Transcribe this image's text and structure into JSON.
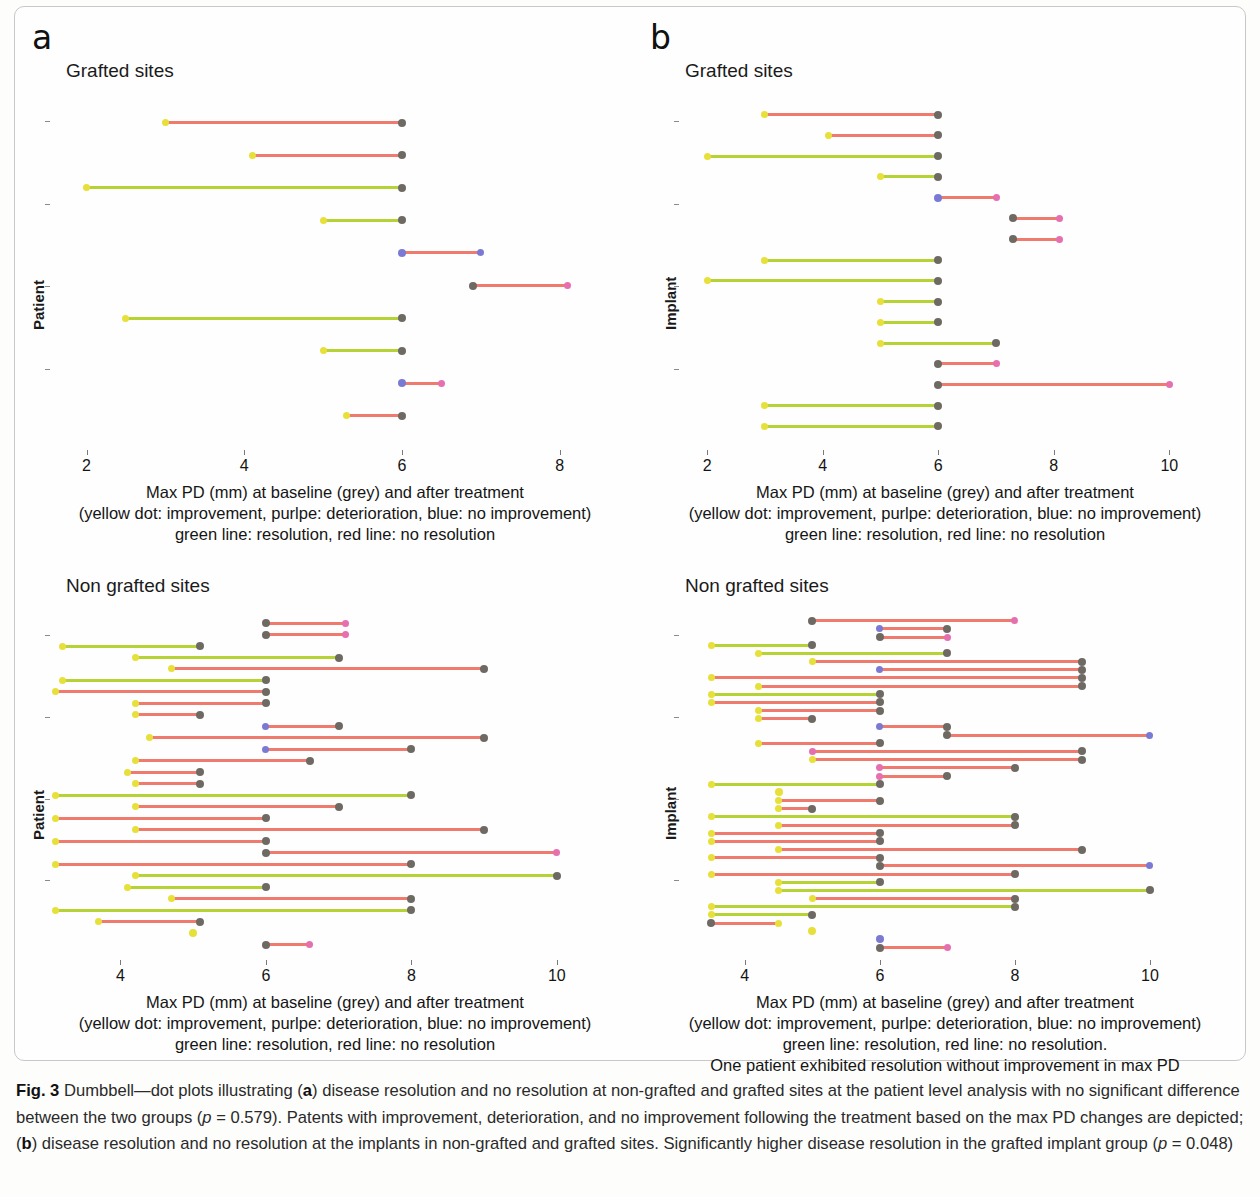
{
  "figure": {
    "caption_label": "Fig. 3",
    "caption_text": " Dumbbell—dot plots illustrating (a) disease resolution and no resolution at non-grafted and grafted sites at the patient level analysis with no significant difference between the two groups (p = 0.579). Patents with improvement, deterioration, and no improvement following the treatment based on the max PD changes are depicted; (b) disease resolution and no resolution at the implants in non-grafted and grafted sites. Significantly higher disease resolution in the grafted implant group (p = 0.048)"
  },
  "panels": {
    "a": {
      "letter": "a",
      "charts": [
        {
          "title": "Grafted sites",
          "ylabel": "Patient",
          "caption_lines": [
            "Max PD (mm) at baseline (grey) and after treatment",
            "(yellow dot: improvement, purlpe: deterioration, blue: no improvement)",
            "green line: resolution, red line: no resolution"
          ]
        },
        {
          "title": "Non grafted sites",
          "ylabel": "Patient",
          "caption_lines": [
            "Max PD (mm) at baseline (grey) and after treatment",
            "(yellow dot: improvement, purlpe: deterioration, blue: no improvement)",
            "green line: resolution, red line: no resolution"
          ]
        }
      ]
    },
    "b": {
      "letter": "b",
      "charts": [
        {
          "title": "Grafted sites",
          "ylabel": "Implant",
          "caption_lines": [
            "Max PD (mm) at baseline (grey) and after treatment",
            "(yellow dot: improvement, purlpe: deterioration, blue: no improvement)",
            "green line: resolution, red line: no resolution"
          ]
        },
        {
          "title": "Non grafted sites",
          "ylabel": "Implant",
          "caption_lines": [
            "Max PD (mm) at baseline (grey) and after treatment",
            "(yellow dot: improvement, purlpe: deterioration, blue: no improvement)",
            "green line: resolution, red line: no resolution.",
            "One patient exhibited resolution without improvement in max PD"
          ]
        }
      ]
    }
  },
  "colors": {
    "line_resolution": "#b5d334",
    "line_no_resolution": "#ef7b6e",
    "dot_baseline_grey": "#6e6a63",
    "dot_improvement_yellow": "#e8e03a",
    "dot_deterioration_purple": "#e66fb0",
    "dot_no_improvement_blue": "#7a7ad4"
  },
  "chart_data": [
    {
      "id": "a-grafted",
      "type": "dumbbell",
      "title": "Grafted sites",
      "xlabel": "Max PD (mm) at baseline (grey) and after treatment",
      "ylabel": "Patient",
      "xlim": [
        1.6,
        8.7
      ],
      "xticks": [
        2,
        4,
        6,
        8
      ],
      "grid": false,
      "legend": "none",
      "rows": [
        {
          "baseline": 6.0,
          "after": 3.0,
          "line": "no_resolution",
          "after_dot": "improvement"
        },
        {
          "baseline": 6.0,
          "after": 4.1,
          "line": "no_resolution",
          "after_dot": "improvement"
        },
        {
          "baseline": 6.0,
          "after": 2.0,
          "line": "resolution",
          "after_dot": "improvement"
        },
        {
          "baseline": 6.0,
          "after": 5.0,
          "line": "resolution",
          "after_dot": "improvement"
        },
        {
          "baseline": 6.0,
          "after": 7.0,
          "line": "no_resolution",
          "after_dot": "no_improvement",
          "dot_on_baseline": "no_improvement"
        },
        {
          "baseline": 6.9,
          "after": 8.1,
          "line": "no_resolution",
          "after_dot": "deterioration"
        },
        {
          "baseline": 6.0,
          "after": 2.5,
          "line": "resolution",
          "after_dot": "improvement"
        },
        {
          "baseline": 6.0,
          "after": 5.0,
          "line": "resolution",
          "after_dot": "improvement"
        },
        {
          "baseline": 6.0,
          "after": 6.5,
          "line": "no_resolution",
          "after_dot": "deterioration",
          "dot_on_baseline": "no_improvement"
        },
        {
          "baseline": 6.0,
          "after": 5.3,
          "line": "no_resolution",
          "after_dot": "improvement"
        }
      ]
    },
    {
      "id": "a-nongrafted",
      "type": "dumbbell",
      "title": "Non grafted sites",
      "xlabel": "Max PD (mm) at baseline (grey) and after treatment",
      "ylabel": "Patient",
      "xlim": [
        3.1,
        10.8
      ],
      "xticks": [
        4,
        6,
        8,
        10
      ],
      "grid": false,
      "legend": "none",
      "rows": [
        {
          "baseline": 6.0,
          "after": 7.1,
          "line": "no_resolution",
          "after_dot": "deterioration"
        },
        {
          "baseline": 6.0,
          "after": 7.1,
          "line": "no_resolution",
          "after_dot": "deterioration"
        },
        {
          "baseline": 5.1,
          "after": 3.2,
          "line": "resolution",
          "after_dot": "improvement"
        },
        {
          "baseline": 7.0,
          "after": 4.2,
          "line": "resolution",
          "after_dot": "improvement"
        },
        {
          "baseline": 9.0,
          "after": 4.7,
          "line": "no_resolution",
          "after_dot": "improvement"
        },
        {
          "baseline": 6.0,
          "after": 3.2,
          "line": "resolution",
          "after_dot": "improvement"
        },
        {
          "baseline": 6.0,
          "after": 3.1,
          "line": "no_resolution",
          "after_dot": "improvement"
        },
        {
          "baseline": 6.0,
          "after": 4.2,
          "line": "no_resolution",
          "after_dot": "improvement"
        },
        {
          "baseline": 5.1,
          "after": 4.2,
          "line": "no_resolution",
          "after_dot": "improvement"
        },
        {
          "baseline": 7.0,
          "after": 6.0,
          "line": "no_resolution",
          "after_dot": "no_improvement"
        },
        {
          "baseline": 9.0,
          "after": 4.4,
          "line": "no_resolution",
          "after_dot": "improvement"
        },
        {
          "baseline": 8.0,
          "after": 6.0,
          "line": "no_resolution",
          "after_dot": "no_improvement"
        },
        {
          "baseline": 6.6,
          "after": 4.2,
          "line": "no_resolution",
          "after_dot": "improvement"
        },
        {
          "baseline": 5.1,
          "after": 4.1,
          "line": "no_resolution",
          "after_dot": "improvement"
        },
        {
          "baseline": 5.1,
          "after": 4.2,
          "line": "no_resolution",
          "after_dot": "improvement"
        },
        {
          "baseline": 8.0,
          "after": 3.1,
          "line": "resolution",
          "after_dot": "improvement"
        },
        {
          "baseline": 7.0,
          "after": 4.2,
          "line": "no_resolution",
          "after_dot": "improvement"
        },
        {
          "baseline": 6.0,
          "after": 3.1,
          "line": "no_resolution",
          "after_dot": "improvement"
        },
        {
          "baseline": 9.0,
          "after": 4.2,
          "line": "no_resolution",
          "after_dot": "improvement"
        },
        {
          "baseline": 6.0,
          "after": 3.1,
          "line": "no_resolution",
          "after_dot": "improvement"
        },
        {
          "baseline": 6.0,
          "after": 10.0,
          "line": "no_resolution",
          "after_dot": "deterioration"
        },
        {
          "baseline": 8.0,
          "after": 3.1,
          "line": "no_resolution",
          "after_dot": "improvement"
        },
        {
          "baseline": 10.0,
          "after": 4.2,
          "line": "resolution",
          "after_dot": "improvement"
        },
        {
          "baseline": 6.0,
          "after": 4.1,
          "line": "resolution",
          "after_dot": "improvement"
        },
        {
          "baseline": 8.0,
          "after": 4.7,
          "line": "no_resolution",
          "after_dot": "improvement"
        },
        {
          "baseline": 8.0,
          "after": 3.1,
          "line": "resolution",
          "after_dot": "improvement"
        },
        {
          "baseline": 5.1,
          "after": 3.7,
          "line": "no_resolution",
          "after_dot": "improvement"
        },
        {
          "baseline": 5.0,
          "after": 5.0,
          "line": "resolution",
          "after_dot": "improvement",
          "single_point": true
        },
        {
          "baseline": 6.0,
          "after": 6.6,
          "line": "no_resolution",
          "after_dot": "deterioration"
        }
      ]
    },
    {
      "id": "b-grafted",
      "type": "dumbbell",
      "title": "Grafted sites",
      "xlabel": "Max PD (mm) at baseline (grey) and after treatment",
      "ylabel": "Implant",
      "xlim": [
        1.6,
        10.6
      ],
      "xticks": [
        2,
        4,
        6,
        8,
        10
      ],
      "grid": false,
      "legend": "none",
      "rows": [
        {
          "baseline": 6.0,
          "after": 3.0,
          "line": "no_resolution",
          "after_dot": "improvement"
        },
        {
          "baseline": 6.0,
          "after": 4.1,
          "line": "no_resolution",
          "after_dot": "improvement"
        },
        {
          "baseline": 6.0,
          "after": 2.0,
          "line": "resolution",
          "after_dot": "improvement"
        },
        {
          "baseline": 6.0,
          "after": 5.0,
          "line": "resolution",
          "after_dot": "improvement"
        },
        {
          "baseline": 6.0,
          "after": 7.0,
          "line": "no_resolution",
          "after_dot": "deterioration",
          "dot_on_baseline": "no_improvement"
        },
        {
          "baseline": 7.3,
          "after": 8.1,
          "line": "no_resolution",
          "after_dot": "deterioration"
        },
        {
          "baseline": 7.3,
          "after": 8.1,
          "line": "no_resolution",
          "after_dot": "deterioration"
        },
        {
          "baseline": 6.0,
          "after": 3.0,
          "line": "resolution",
          "after_dot": "improvement"
        },
        {
          "baseline": 6.0,
          "after": 2.0,
          "line": "resolution",
          "after_dot": "improvement"
        },
        {
          "baseline": 6.0,
          "after": 5.0,
          "line": "resolution",
          "after_dot": "improvement"
        },
        {
          "baseline": 6.0,
          "after": 5.0,
          "line": "resolution",
          "after_dot": "improvement"
        },
        {
          "baseline": 7.0,
          "after": 5.0,
          "line": "resolution",
          "after_dot": "improvement"
        },
        {
          "baseline": 6.0,
          "after": 7.0,
          "line": "no_resolution",
          "after_dot": "deterioration"
        },
        {
          "baseline": 6.0,
          "after": 10.0,
          "line": "no_resolution",
          "after_dot": "deterioration"
        },
        {
          "baseline": 6.0,
          "after": 3.0,
          "line": "resolution",
          "after_dot": "improvement"
        },
        {
          "baseline": 6.0,
          "after": 3.0,
          "line": "resolution",
          "after_dot": "improvement"
        }
      ]
    },
    {
      "id": "b-nongrafted",
      "type": "dumbbell",
      "title": "Non grafted sites",
      "xlabel": "Max PD (mm) at baseline (grey) and after treatment",
      "ylabel": "Implant",
      "xlim": [
        3.1,
        10.8
      ],
      "xticks": [
        4,
        6,
        8,
        10
      ],
      "grid": false,
      "legend": "none",
      "rows": [
        {
          "baseline": 5.0,
          "after": 8.0,
          "line": "no_resolution",
          "after_dot": "deterioration"
        },
        {
          "baseline": 7.0,
          "after": 6.0,
          "line": "no_resolution",
          "after_dot": "no_improvement"
        },
        {
          "baseline": 6.0,
          "after": 7.0,
          "line": "no_resolution",
          "after_dot": "deterioration"
        },
        {
          "baseline": 5.0,
          "after": 3.5,
          "line": "resolution",
          "after_dot": "improvement"
        },
        {
          "baseline": 7.0,
          "after": 4.2,
          "line": "resolution",
          "after_dot": "improvement"
        },
        {
          "baseline": 9.0,
          "after": 5.0,
          "line": "no_resolution",
          "after_dot": "improvement"
        },
        {
          "baseline": 9.0,
          "after": 6.0,
          "line": "no_resolution",
          "after_dot": "no_improvement"
        },
        {
          "baseline": 9.0,
          "after": 3.5,
          "line": "no_resolution",
          "after_dot": "improvement"
        },
        {
          "baseline": 9.0,
          "after": 4.2,
          "line": "no_resolution",
          "after_dot": "improvement"
        },
        {
          "baseline": 6.0,
          "after": 3.5,
          "line": "resolution",
          "after_dot": "improvement"
        },
        {
          "baseline": 6.0,
          "after": 3.5,
          "line": "no_resolution",
          "after_dot": "improvement"
        },
        {
          "baseline": 6.0,
          "after": 4.2,
          "line": "no_resolution",
          "after_dot": "improvement"
        },
        {
          "baseline": 5.0,
          "after": 4.2,
          "line": "no_resolution",
          "after_dot": "improvement"
        },
        {
          "baseline": 7.0,
          "after": 6.0,
          "line": "no_resolution",
          "after_dot": "no_improvement"
        },
        {
          "baseline": 7.0,
          "after": 10.0,
          "line": "no_resolution",
          "after_dot": "no_improvement"
        },
        {
          "baseline": 6.0,
          "after": 4.2,
          "line": "no_resolution",
          "after_dot": "improvement"
        },
        {
          "baseline": 9.0,
          "after": 5.0,
          "line": "no_resolution",
          "after_dot": "deterioration"
        },
        {
          "baseline": 9.0,
          "after": 5.0,
          "line": "no_resolution",
          "after_dot": "improvement"
        },
        {
          "baseline": 8.0,
          "after": 6.0,
          "line": "no_resolution",
          "after_dot": "deterioration"
        },
        {
          "baseline": 7.0,
          "after": 6.0,
          "line": "no_resolution",
          "after_dot": "deterioration"
        },
        {
          "baseline": 6.0,
          "after": 3.5,
          "line": "resolution",
          "after_dot": "improvement"
        },
        {
          "baseline": 4.5,
          "after": 4.5,
          "line": "resolution",
          "after_dot": "improvement",
          "single_point": true
        },
        {
          "baseline": 6.0,
          "after": 4.5,
          "line": "no_resolution",
          "after_dot": "improvement"
        },
        {
          "baseline": 5.0,
          "after": 4.5,
          "line": "no_resolution",
          "after_dot": "improvement"
        },
        {
          "baseline": 8.0,
          "after": 3.5,
          "line": "resolution",
          "after_dot": "improvement"
        },
        {
          "baseline": 8.0,
          "after": 4.5,
          "line": "no_resolution",
          "after_dot": "improvement"
        },
        {
          "baseline": 6.0,
          "after": 3.5,
          "line": "no_resolution",
          "after_dot": "improvement"
        },
        {
          "baseline": 6.0,
          "after": 3.5,
          "line": "no_resolution",
          "after_dot": "improvement"
        },
        {
          "baseline": 9.0,
          "after": 4.5,
          "line": "no_resolution",
          "after_dot": "improvement"
        },
        {
          "baseline": 6.0,
          "after": 3.5,
          "line": "no_resolution",
          "after_dot": "improvement"
        },
        {
          "baseline": 6.0,
          "after": 10.0,
          "line": "no_resolution",
          "after_dot": "no_improvement"
        },
        {
          "baseline": 8.0,
          "after": 3.5,
          "line": "no_resolution",
          "after_dot": "improvement"
        },
        {
          "baseline": 6.0,
          "after": 4.5,
          "line": "resolution",
          "after_dot": "improvement"
        },
        {
          "baseline": 10.0,
          "after": 4.5,
          "line": "resolution",
          "after_dot": "improvement"
        },
        {
          "baseline": 8.0,
          "after": 5.0,
          "line": "no_resolution",
          "after_dot": "improvement"
        },
        {
          "baseline": 8.0,
          "after": 3.5,
          "line": "resolution",
          "after_dot": "improvement"
        },
        {
          "baseline": 5.0,
          "after": 3.5,
          "line": "resolution",
          "after_dot": "improvement"
        },
        {
          "baseline": 3.5,
          "after": 4.5,
          "line": "no_resolution",
          "after_dot": "improvement"
        },
        {
          "baseline": 5.0,
          "after": 5.0,
          "line": "resolution",
          "after_dot": "improvement",
          "single_point": true
        },
        {
          "baseline": 6.0,
          "after": 6.0,
          "line": "none",
          "after_dot": "no_improvement",
          "single_point": true
        },
        {
          "baseline": 6.0,
          "after": 7.0,
          "line": "no_resolution",
          "after_dot": "deterioration"
        }
      ]
    }
  ]
}
